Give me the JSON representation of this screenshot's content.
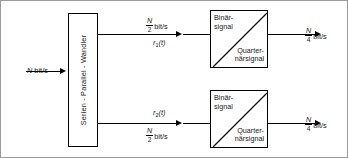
{
  "figure": {
    "type": "block-diagram",
    "language": "de",
    "background_color": "#ffffff",
    "line_color": "#000000",
    "frame_color": "#9a9a9a"
  },
  "input": {
    "rate_symbol": "N",
    "rate_unit": "bit/s",
    "label": "N bit/s"
  },
  "converter_block": {
    "label": "Serien - Parallel - Wandler"
  },
  "branches": [
    {
      "id": "upper",
      "rate_numerator": "N",
      "rate_denominator": "2",
      "rate_unit": "bit/s",
      "signal_symbol": "r",
      "signal_subscript": "1",
      "signal_label": "r₁(t)",
      "mapper": {
        "input_label": "Binär-\nsignal",
        "output_label": "Quarter-\nnärsignal"
      },
      "output_numerator": "N",
      "output_denominator": "4",
      "output_unit": "bit/s"
    },
    {
      "id": "lower",
      "rate_numerator": "N",
      "rate_denominator": "2",
      "rate_unit": "bit/s",
      "signal_symbol": "r",
      "signal_subscript": "2",
      "signal_label": "r₂(t)",
      "mapper": {
        "input_label": "Binär-\nsignal",
        "output_label": "Quarter-\nnärsignal"
      },
      "output_numerator": "N",
      "output_denominator": "4",
      "output_unit": "bit/s"
    }
  ]
}
